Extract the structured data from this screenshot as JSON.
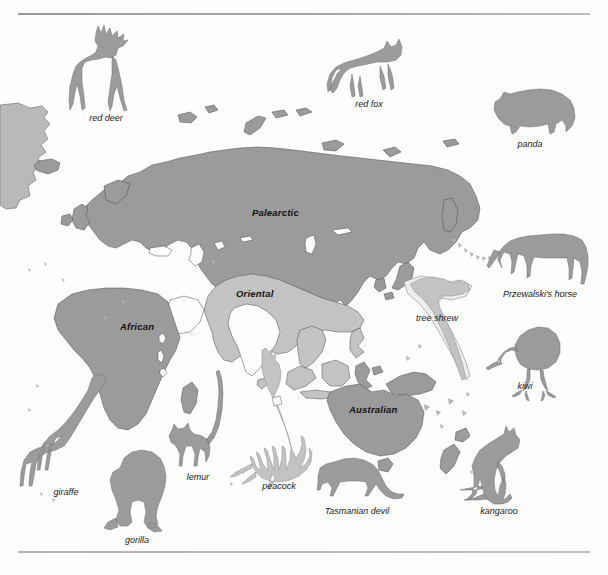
{
  "figure": {
    "kind": "biogeographic-realms-map",
    "background_color": "#fdfdfc",
    "land_color": "#9b9b9b",
    "oriental_color": "#c3c3c3",
    "outline_color": "#4a4a4a",
    "rule_color": "#a8a8a8"
  },
  "realms": [
    {
      "id": "palearctic",
      "label": "Palearctic",
      "x": 282,
      "y": 213,
      "color": "#9b9b9b"
    },
    {
      "id": "oriental",
      "label": "Oriental",
      "x": 260,
      "y": 294,
      "color": "#c3c3c3"
    },
    {
      "id": "african",
      "label": "African",
      "x": 139,
      "y": 327,
      "color": "#9b9b9b"
    },
    {
      "id": "australian",
      "label": "Australian",
      "x": 374,
      "y": 410,
      "color": "#9b9b9b"
    }
  ],
  "animals": [
    {
      "id": "red-deer",
      "label": "red deer",
      "label_x": 106,
      "label_y": 121,
      "realm": "palearctic",
      "tone": "dark"
    },
    {
      "id": "red-fox",
      "label": "red fox",
      "label_x": 369,
      "label_y": 107,
      "realm": "palearctic",
      "tone": "dark"
    },
    {
      "id": "panda",
      "label": "panda",
      "label_x": 530,
      "label_y": 147,
      "realm": "palearctic",
      "tone": "dark"
    },
    {
      "id": "przewalskis-horse",
      "label": "Przewalski's horse",
      "label_x": 540,
      "label_y": 297,
      "realm": "palearctic",
      "tone": "dark"
    },
    {
      "id": "tree-shrew",
      "label": "tree shrew",
      "label_x": 437,
      "label_y": 321,
      "realm": "oriental",
      "tone": "light"
    },
    {
      "id": "kiwi",
      "label": "kiwi",
      "label_x": 525,
      "label_y": 389,
      "realm": "australian",
      "tone": "dark"
    },
    {
      "id": "giraffe",
      "label": "giraffe",
      "label_x": 66,
      "label_y": 495,
      "realm": "african",
      "tone": "dark"
    },
    {
      "id": "gorilla",
      "label": "gorilla",
      "label_x": 137,
      "label_y": 543,
      "realm": "african",
      "tone": "dark"
    },
    {
      "id": "lemur",
      "label": "lemur",
      "label_x": 198,
      "label_y": 480,
      "realm": "african",
      "tone": "dark"
    },
    {
      "id": "peacock",
      "label": "peacock",
      "label_x": 279,
      "label_y": 489,
      "realm": "oriental",
      "tone": "light"
    },
    {
      "id": "tasmanian-devil",
      "label": "Tasmanian devil",
      "label_x": 357,
      "label_y": 514,
      "realm": "australian",
      "tone": "dark"
    },
    {
      "id": "kangaroo",
      "label": "kangaroo",
      "label_x": 499,
      "label_y": 514,
      "realm": "australian",
      "tone": "dark"
    }
  ]
}
